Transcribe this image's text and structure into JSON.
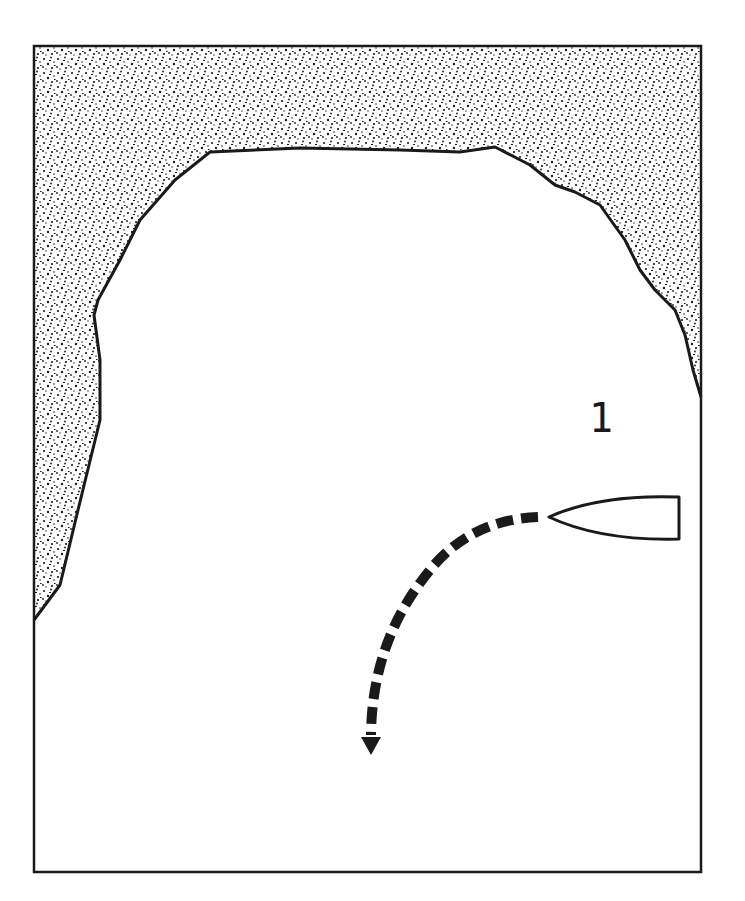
{
  "diagram": {
    "type": "nautical-maneuver",
    "position_label": "1",
    "elements": {
      "land": {
        "fill_pattern": "stipple",
        "color": "#1a1a1a"
      },
      "water": {
        "color": "#ffffff"
      },
      "boat": {
        "heading": "west",
        "outline_color": "#1a1a1a"
      },
      "course_arrow": {
        "style": "dashed",
        "turn": "left, curving south",
        "color": "#1a1a1a"
      }
    }
  },
  "colors": {
    "ink": "#1a1a1a",
    "paper": "#ffffff"
  }
}
